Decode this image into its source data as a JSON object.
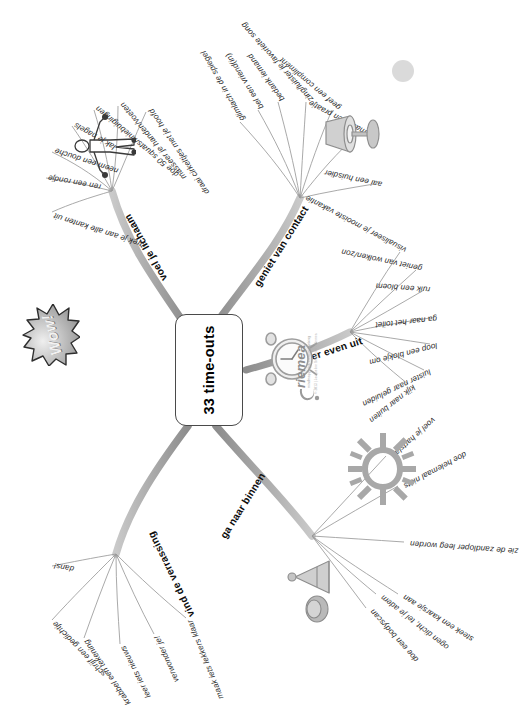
{
  "poster": {
    "title": "33 time-outs",
    "language": "nl",
    "orientation": "rotated-90-ccw",
    "background_color": "#ffffff",
    "accent_color": "#8e8e8e",
    "text_color": "#1a1a1a"
  },
  "center": {
    "label": "33 time-outs"
  },
  "decorations": {
    "wow_label": "Wow!",
    "sun_icon": "sun-icon",
    "figure_icon": "stretching-person-icon",
    "clock_icon": "alarm-clock-icon",
    "bell_icon": "singing-bowl-icon",
    "lamp_icon": "table-lamp-icon",
    "corner_dot": "decorative-dot"
  },
  "logo": {
    "brand": "riemea",
    "tagline": "mindmapping & creative thinking",
    "copyright": "© 2013 | Jacqueline Schaeken - Riemea"
  },
  "branches": [
    {
      "id": "voel-je-lichaam",
      "title": "voel je lichaam",
      "leaves": [
        "strek je aan alle kanten uit",
        "ren een rondje",
        "neem een douche",
        "lak je nagels",
        "doe 50 squats/kniebuigingen",
        "masseer je handen/voeten",
        "draai cirkeltjes met je hoofd"
      ]
    },
    {
      "id": "geniet-van-contact",
      "title": "geniet van contact",
      "leaves": [
        "aai een huisdier",
        "maak een praatje",
        "geef een compliment",
        "zing/luister je favoriete song",
        "bedank iemand",
        "bel een vriend(in)",
        "glimlach in de spiegel"
      ]
    },
    {
      "id": "vind-de-verrassing",
      "title": "vind de verrassing",
      "leaves": [
        "dans!",
        "schrijf een gedichtje",
        "krabbel een tekening",
        "leer iets nieuws",
        "verwonder je!",
        "maak iets lekkers klaar"
      ]
    },
    {
      "id": "ga-naar-binnen",
      "title": "ga naar binnen",
      "leaves": [
        "ogen dicht, tel je adem",
        "doe een bodyscan",
        "steek een kaarsje aan",
        "zie de zandloper leeg worden",
        "doe helemaal niets",
        "voel je hartslag"
      ]
    },
    {
      "id": "ga-er-even-uit",
      "title": "ga er even uit",
      "leaves": [
        "kijk naar buiten",
        "luister naar geluiden",
        "loop een blokje om",
        "ga naar het toilet",
        "ruik een bloem",
        "geniet van wolken/zon",
        "visualiseer je mooiste vakantie"
      ]
    }
  ]
}
